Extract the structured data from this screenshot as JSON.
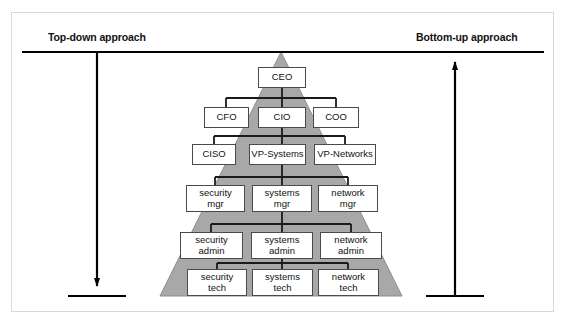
{
  "figure": {
    "background_color": "#ffffff",
    "frame_color": "#d8d8d8",
    "pyramid_fill": "#a8a8a8",
    "pyramid_stroke": "#7d7d7d",
    "node_fill": "#ffffff",
    "node_stroke": "#4a4a4a",
    "connector_color": "#1a1a1a",
    "arrow_color": "#000000"
  },
  "annotations": {
    "top_down": {
      "label": "Top-down approach",
      "direction": "down",
      "arrow_x": 97,
      "line_y": 52,
      "baseline_y": 296
    },
    "bottom_up": {
      "label": "Bottom-up approach",
      "direction": "up",
      "arrow_x": 455,
      "line_y": 52,
      "baseline_y": 296
    },
    "rule_top": {
      "x1": 22,
      "x2": 544,
      "y": 52
    }
  },
  "pyramid": {
    "apex_x": 281,
    "apex_y": 52,
    "base_left_x": 160,
    "base_right_x": 402,
    "base_y": 296
  },
  "hierarchy": {
    "levels": [
      {
        "level": 1,
        "name": "executive",
        "nodes": [
          {
            "label_lines": [
              "CEO"
            ],
            "x": 258,
            "y": 67,
            "w": 48,
            "h": 21
          }
        ]
      },
      {
        "level": 2,
        "name": "c-suite",
        "nodes": [
          {
            "label_lines": [
              "CFO"
            ],
            "x": 204,
            "y": 107,
            "w": 45,
            "h": 21
          },
          {
            "label_lines": [
              "CIO"
            ],
            "x": 258,
            "y": 107,
            "w": 48,
            "h": 21
          },
          {
            "label_lines": [
              "COO"
            ],
            "x": 313,
            "y": 107,
            "w": 46,
            "h": 21
          }
        ]
      },
      {
        "level": 3,
        "name": "vice-presidents",
        "nodes": [
          {
            "label_lines": [
              "CISO"
            ],
            "x": 192,
            "y": 144,
            "w": 44,
            "h": 21
          },
          {
            "label_lines": [
              "VP-Systems"
            ],
            "x": 249,
            "y": 144,
            "w": 57,
            "h": 21
          },
          {
            "label_lines": [
              "VP-Networks"
            ],
            "x": 314,
            "y": 144,
            "w": 62,
            "h": 21
          }
        ]
      },
      {
        "level": 4,
        "name": "managers",
        "nodes": [
          {
            "label_lines": [
              "security",
              "mgr"
            ],
            "x": 186,
            "y": 185,
            "w": 59,
            "h": 27
          },
          {
            "label_lines": [
              "systems",
              "mgr"
            ],
            "x": 252,
            "y": 185,
            "w": 60,
            "h": 27
          },
          {
            "label_lines": [
              "network",
              "mgr"
            ],
            "x": 318,
            "y": 185,
            "w": 60,
            "h": 27
          }
        ]
      },
      {
        "level": 5,
        "name": "administrators",
        "nodes": [
          {
            "label_lines": [
              "security",
              "admin"
            ],
            "x": 180,
            "y": 232,
            "w": 63,
            "h": 27
          },
          {
            "label_lines": [
              "systems",
              "admin"
            ],
            "x": 251,
            "y": 232,
            "w": 62,
            "h": 27
          },
          {
            "label_lines": [
              "network",
              "admin"
            ],
            "x": 320,
            "y": 232,
            "w": 62,
            "h": 27
          }
        ]
      },
      {
        "level": 6,
        "name": "technicians",
        "nodes": [
          {
            "label_lines": [
              "security",
              "tech"
            ],
            "x": 187,
            "y": 269,
            "w": 60,
            "h": 27
          },
          {
            "label_lines": [
              "systems",
              "tech"
            ],
            "x": 252,
            "y": 269,
            "w": 61,
            "h": 27
          },
          {
            "label_lines": [
              "network",
              "tech"
            ],
            "x": 318,
            "y": 269,
            "w": 61,
            "h": 27
          }
        ]
      }
    ]
  }
}
